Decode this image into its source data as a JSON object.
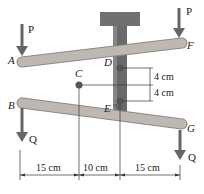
{
  "diagram": {
    "points": {
      "A": "A",
      "B": "B",
      "C": "C",
      "D": "D",
      "E": "E",
      "F": "F",
      "G": "G"
    },
    "forces": {
      "P_left": "P",
      "P_right": "P",
      "Q_left": "Q",
      "Q_right": "Q"
    },
    "dimensions": {
      "horizontal": [
        "15 cm",
        "10 cm",
        "15 cm"
      ],
      "vertical": [
        "4 cm",
        "4 cm"
      ]
    },
    "colors": {
      "bar": "#b5b0aa",
      "bar_edge": "#8e8983",
      "post": "#6e6e6e",
      "arrow": "#666666",
      "line": "#333333"
    }
  }
}
